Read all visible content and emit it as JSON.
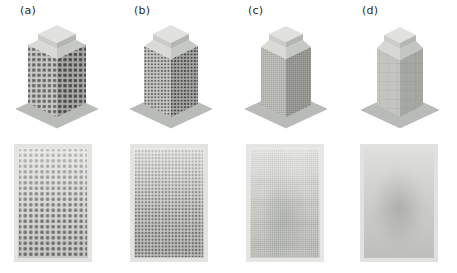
{
  "figure": {
    "type": "technical-illustration",
    "background_color": "#ffffff",
    "width": 457,
    "height": 273
  },
  "palette": {
    "paper": "#ffffff",
    "ground_plane": "#b9bcb8",
    "ground_plane_edge": "#a8aba7",
    "roof_top": "#dedfdc",
    "roof_side_light": "#c9cac6",
    "roof_side_dark": "#b0b2ae",
    "facade_light": "#c6c7c3",
    "facade_dark": "#9a9c98",
    "mesh_line": "#4a4a4a",
    "window_dark": "#5c5c5c",
    "panel_bg": "#d6d7d3",
    "panel_border": "#e8e8e5",
    "label_text": "#2b2b2b",
    "blur_blob": "#a9aba7"
  },
  "columns": [
    {
      "id": "a",
      "label": "(a)",
      "label_x": 20,
      "label_y": 4,
      "mesh": {
        "name": "coarse-mesh",
        "cols": 13,
        "rows": 20,
        "cell_px": 5.2,
        "dot_radius": 1.9,
        "pattern": "dots",
        "density": "coarse"
      },
      "building": {
        "facade_cols": 13,
        "facade_rows": 20,
        "storeys": 20
      },
      "panel": {
        "name": "facade-grid-panel-a",
        "x": 14,
        "y": 146,
        "width": 78,
        "height": 116,
        "grid_cols": 13,
        "grid_rows": 20,
        "marker": "circle"
      }
    },
    {
      "id": "b",
      "label": "(b)",
      "label_x": 134,
      "label_y": 4,
      "mesh": {
        "name": "medium-mesh",
        "cols": 21,
        "rows": 32,
        "cell_px": 3.3,
        "dot_radius": 1.15,
        "pattern": "squares",
        "density": "medium"
      },
      "building": {
        "facade_cols": 21,
        "facade_rows": 32,
        "storeys": 32
      },
      "panel": {
        "name": "facade-grid-panel-b",
        "x": 130,
        "y": 146,
        "width": 78,
        "height": 116,
        "grid_cols": 21,
        "grid_rows": 32,
        "marker": "square"
      }
    },
    {
      "id": "c",
      "label": "(c)",
      "label_x": 248,
      "label_y": 4,
      "mesh": {
        "name": "fine-mesh",
        "cols": 34,
        "rows": 52,
        "cell_px": 2.0,
        "dot_radius": 0.6,
        "pattern": "fine-grid",
        "density": "fine"
      },
      "building": {
        "facade_cols": 34,
        "facade_rows": 52,
        "storeys": 52
      },
      "panel": {
        "name": "facade-grid-panel-c",
        "x": 246,
        "y": 146,
        "width": 78,
        "height": 116,
        "grid_cols": 34,
        "grid_rows": 52,
        "marker": "hairline"
      }
    },
    {
      "id": "d",
      "label": "(d)",
      "label_x": 362,
      "label_y": 4,
      "mesh": {
        "name": "continuum-smooth",
        "cols": 0,
        "rows": 0,
        "cell_px": 0,
        "dot_radius": 0,
        "pattern": "smooth",
        "density": "continuum"
      },
      "building": {
        "facade_cols": 6,
        "facade_rows": 12,
        "storeys": 12
      },
      "panel": {
        "name": "facade-grid-panel-d",
        "x": 360,
        "y": 146,
        "width": 78,
        "height": 116,
        "grid_cols": 0,
        "grid_rows": 0,
        "marker": "blur-blob"
      }
    }
  ]
}
